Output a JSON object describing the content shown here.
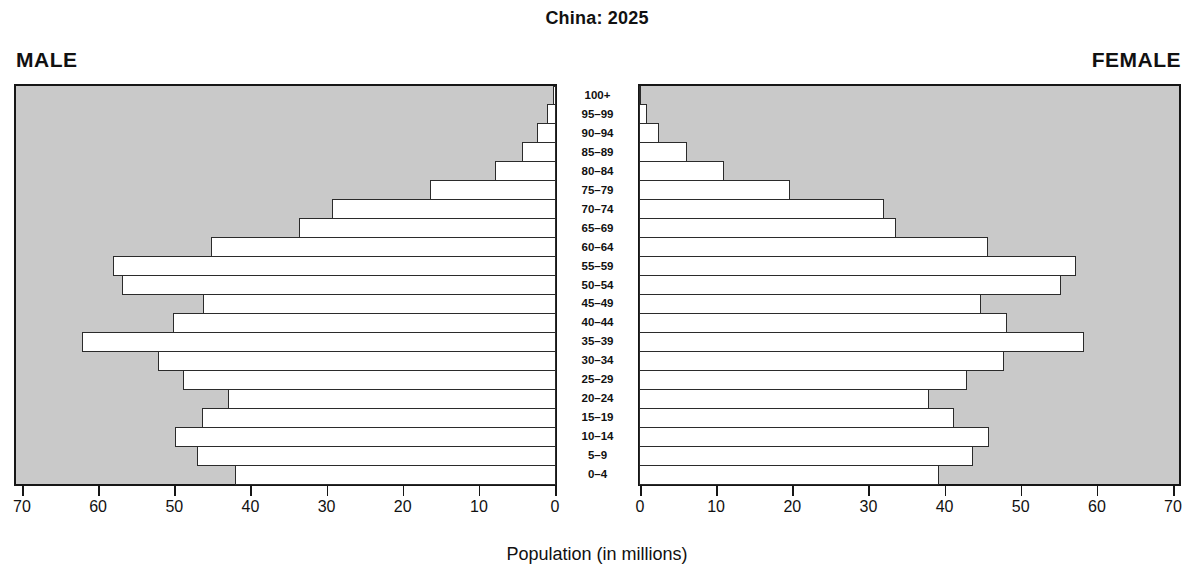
{
  "title": "China: 2025",
  "male_header": "MALE",
  "female_header": "FEMALE",
  "xlabel": "Population (in millions)",
  "chart_data": {
    "type": "bar",
    "subtype": "population-pyramid",
    "title": "China: 2025",
    "xlabel": "Population (in millions)",
    "axis_max": 70,
    "tick_values": [
      0,
      10,
      20,
      30,
      40,
      50,
      60,
      70
    ],
    "grid": false,
    "legend": "none",
    "age_groups_top_to_bottom": [
      "100+",
      "95–99",
      "90–94",
      "85–89",
      "80–84",
      "75–79",
      "70–74",
      "65–69",
      "60–64",
      "55–59",
      "50–54",
      "45–49",
      "40–44",
      "35–39",
      "30–34",
      "25–29",
      "20–24",
      "15–19",
      "10–14",
      "5–9",
      "0–4"
    ],
    "series": [
      {
        "name": "Male",
        "side": "left",
        "values_millions": [
          0.4,
          1.2,
          2.5,
          4.5,
          8.0,
          16.6,
          29.4,
          33.7,
          45.3,
          58.2,
          57.0,
          46.4,
          50.3,
          62.3,
          52.3,
          49.0,
          43.1,
          46.5,
          50.1,
          47.2,
          42.2
        ]
      },
      {
        "name": "Female",
        "side": "right",
        "values_millions": [
          0.2,
          1.0,
          2.6,
          6.3,
          11.2,
          19.8,
          32.2,
          33.7,
          45.8,
          57.4,
          55.4,
          44.9,
          48.3,
          58.5,
          48.0,
          43.1,
          38.1,
          41.4,
          46.0,
          43.9,
          39.4
        ]
      }
    ],
    "colors": {
      "panel_background": "#c9c9c9",
      "bar_fill": "#ffffff",
      "bar_border": "#2b2b2b",
      "frame_border": "#161616",
      "text": "#111111"
    }
  }
}
